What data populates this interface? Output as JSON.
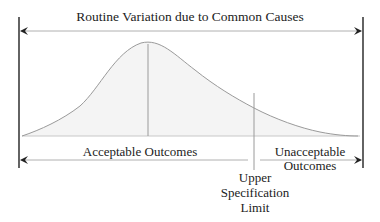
{
  "diagram": {
    "title": "Routine Variation due to Common Causes",
    "regions": {
      "acceptable": "Acceptable Outcomes",
      "unacceptable_line1": "Unacceptable",
      "unacceptable_line2": "Outcomes"
    },
    "spec_limit": {
      "line1": "Upper",
      "line2": "Specification",
      "line3": "Limit"
    },
    "colors": {
      "curve": "#9a9a9a",
      "fill": "#f4f4f4",
      "axis": "#c8c8c8",
      "bounds": "#222222",
      "arrow": "#b0b0b0",
      "text": "#222222"
    },
    "geometry": {
      "left_bound_x": 19,
      "right_bound_x": 363,
      "top_arrow_y": 31,
      "bottom_arrow_y": 160,
      "baseline_y": 136,
      "mean_x": 148,
      "usl_x": 254
    }
  }
}
